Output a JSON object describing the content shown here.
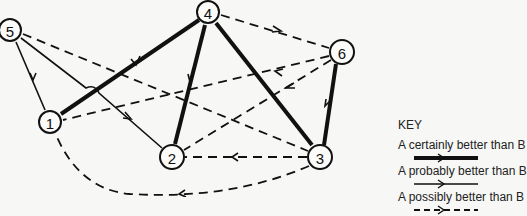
{
  "diagram": {
    "nodes": [
      {
        "id": "1",
        "label": "1",
        "x": 50,
        "y": 122
      },
      {
        "id": "2",
        "label": "2",
        "x": 172,
        "y": 157
      },
      {
        "id": "3",
        "label": "3",
        "x": 320,
        "y": 157
      },
      {
        "id": "4",
        "label": "4",
        "x": 208,
        "y": 12
      },
      {
        "id": "5",
        "label": "5",
        "x": 10,
        "y": 30
      },
      {
        "id": "6",
        "label": "6",
        "x": 342,
        "y": 52
      }
    ],
    "edges": [
      {
        "from": "4",
        "to": "1",
        "type": "certainly"
      },
      {
        "from": "4",
        "to": "2",
        "type": "certainly"
      },
      {
        "from": "4",
        "to": "3",
        "type": "certainly"
      },
      {
        "from": "6",
        "to": "3",
        "type": "certainly"
      },
      {
        "from": "5",
        "to": "1",
        "type": "probably"
      },
      {
        "from": "5",
        "to": "2",
        "type": "probably"
      },
      {
        "from": "4",
        "to": "6",
        "type": "possibly"
      },
      {
        "from": "5",
        "to": "3",
        "type": "possibly"
      },
      {
        "from": "6",
        "to": "1",
        "type": "possibly"
      },
      {
        "from": "6",
        "to": "2",
        "type": "possibly"
      },
      {
        "from": "3",
        "to": "2",
        "type": "possibly"
      },
      {
        "from": "3",
        "to": "1",
        "type": "possibly"
      }
    ]
  },
  "key": {
    "title": "KEY",
    "items": [
      {
        "label": "A certainly better than B",
        "style": "thick solid arrow"
      },
      {
        "label": "A probably better than B",
        "style": "thin solid arrow"
      },
      {
        "label": "A possibly better than B",
        "style": "dashed arrow"
      }
    ]
  }
}
